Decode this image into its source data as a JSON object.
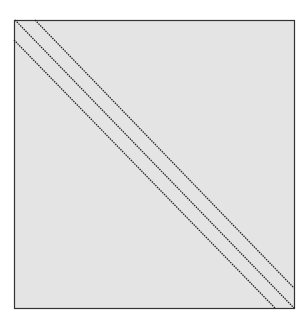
{
  "diagram": {
    "type": "square-with-diagonals",
    "colors": {
      "background": "#ffffff",
      "fill": "#e4e4e4",
      "border": "#333333",
      "line": "#222222"
    },
    "square": {
      "x": 14,
      "y": 20,
      "width": 280,
      "height": 288
    },
    "lines": [
      {
        "x1": 35,
        "y1": 20,
        "x2": 294,
        "y2": 288,
        "style": "dotted"
      },
      {
        "x1": 15,
        "y1": 20,
        "x2": 294,
        "y2": 308,
        "style": "dotted"
      },
      {
        "x1": 14,
        "y1": 40,
        "x2": 275,
        "y2": 308,
        "style": "dotted"
      }
    ]
  }
}
